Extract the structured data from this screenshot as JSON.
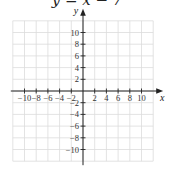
{
  "chart_data": {
    "type": "line",
    "title": "y = x − 7",
    "xlabel": "x",
    "ylabel": "y",
    "xlim": [
      -12,
      12
    ],
    "ylim": [
      -12,
      12
    ],
    "grid": true,
    "x_ticks": [
      -10,
      -8,
      -6,
      -4,
      -2,
      2,
      4,
      6,
      8,
      10
    ],
    "y_ticks": [
      10,
      8,
      6,
      4,
      2,
      -2,
      -4,
      -6,
      -8,
      -10
    ],
    "x_tick_labels": [
      "−10",
      "−8",
      "−6",
      "−4",
      "−2",
      "2",
      "4",
      "6",
      "8",
      "10"
    ],
    "y_tick_labels": [
      "10",
      "8",
      "6",
      "4",
      "2",
      "−2",
      "−4",
      "−6",
      "−8",
      "−10"
    ],
    "series": [],
    "note": "Empty coordinate grid; equation shown as title, no line plotted"
  },
  "colors": {
    "grid": "#dcdcdc",
    "axis": "#222222",
    "text": "#333333"
  }
}
